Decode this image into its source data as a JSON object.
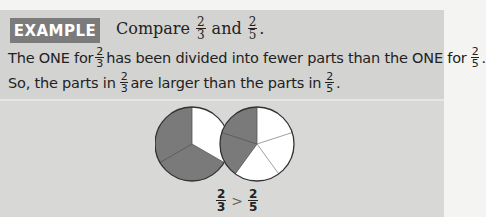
{
  "example": {
    "badge": "EXAMPLE",
    "title_prefix": "Compare",
    "frac_a": {
      "num": "2",
      "den": "3"
    },
    "title_and": "and",
    "frac_b": {
      "num": "2",
      "den": "5"
    },
    "title_end": "."
  },
  "text": {
    "line1": {
      "part1": "The ONE for",
      "frac1": {
        "num": "2",
        "den": "3"
      },
      "part2": "has been divided into fewer parts than the ONE for",
      "frac2": {
        "num": "2",
        "den": "5"
      },
      "end": "."
    },
    "line2": {
      "part1": "So, the parts in",
      "frac1": {
        "num": "2",
        "den": "3"
      },
      "part2": "are larger than the parts in",
      "frac2": {
        "num": "2",
        "den": "5"
      },
      "end": "."
    }
  },
  "figures": {
    "pie_thirds": {
      "parts": 3,
      "shaded": 2,
      "shade_color": "#7a7a7a"
    },
    "pie_fifths": {
      "parts": 5,
      "shaded": 2,
      "shade_color": "#7a7a7a"
    }
  },
  "comparison": {
    "left": {
      "num": "2",
      "den": "3"
    },
    "symbol": ">",
    "right": {
      "num": "2",
      "den": "5"
    }
  }
}
